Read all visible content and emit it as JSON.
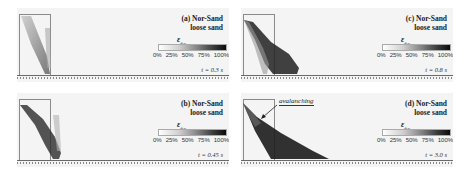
{
  "panels": [
    {
      "id": "a",
      "title_line1": "(a) Nor-Sand",
      "title_line2": "loose sand",
      "time": "t = 0.3 s"
    },
    {
      "id": "c",
      "title_line1": "(c) Nor-Sand",
      "title_line2": "loose sand",
      "time": "t = 0.8 s"
    },
    {
      "id": "b",
      "title_line1": "(b) Nor-Sand",
      "title_line2": "loose sand",
      "time": "t = 0.45 s"
    },
    {
      "id": "d",
      "title_line1": "(d) Nor-Sand",
      "title_line2": "loose sand",
      "time": "t = 3.0 s",
      "annotation": "avalanching"
    }
  ],
  "colorbar": {
    "symbol": "ε",
    "subscript": "dev",
    "ticks": [
      "0%",
      "25%",
      "50%",
      "75%",
      "100%"
    ],
    "colors": {
      "low": "#ffffff",
      "high": "#0b0b0b"
    }
  }
}
